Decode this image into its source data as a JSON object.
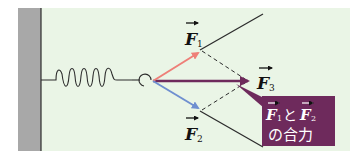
{
  "diagram": {
    "background_color": "#eaf5e6",
    "wall_color": "#a8a8a8",
    "colors": {
      "f1": "#ee7f78",
      "f2": "#6f8fd0",
      "f3": "#6e2a5c",
      "lines": "#2c2c2c",
      "callout_bg": "#6e2a5c",
      "callout_text": "#ffffff"
    },
    "labels": {
      "f1": "F",
      "f1_sub": "1",
      "f2": "F",
      "f2_sub": "2",
      "f3": "F",
      "f3_sub": "3"
    },
    "callout": {
      "line1_a": "F",
      "line1_a_sub": "1",
      "line1_mid": "と",
      "line1_b": "F",
      "line1_b_sub": "2",
      "line2": "の合力"
    }
  }
}
